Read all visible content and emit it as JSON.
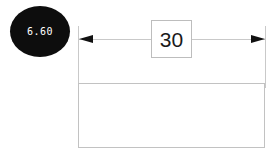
{
  "drawing": {
    "background_color": "#ffffff",
    "callout_badge": {
      "icon": "ellipse-badge",
      "value": "6.60",
      "fill_color": "#0d0d0d",
      "text_color": "#ffffff"
    },
    "dimension": {
      "value": "30",
      "value_box_border_color": "#bdbdbd",
      "line_color": "#c9c9c9",
      "arrow_color": "#111111",
      "left_arrow_icon": "arrow-left-icon",
      "right_arrow_icon": "arrow-right-icon",
      "left_extension_label": "left-extension-line",
      "right_extension_label": "right-extension-line"
    },
    "part_outline": {
      "label": "",
      "border_color": "#c2c2c2",
      "fill_color": "#ffffff"
    }
  }
}
